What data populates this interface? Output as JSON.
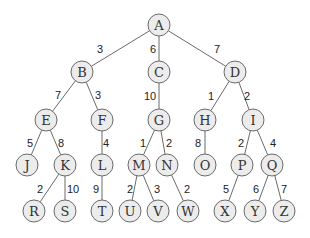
{
  "diagram": {
    "type": "weighted-tree",
    "nodes": [
      {
        "id": "A",
        "x": 159,
        "y": 25
      },
      {
        "id": "B",
        "x": 82,
        "y": 72
      },
      {
        "id": "C",
        "x": 159,
        "y": 72
      },
      {
        "id": "D",
        "x": 235,
        "y": 72
      },
      {
        "id": "E",
        "x": 46,
        "y": 120
      },
      {
        "id": "F",
        "x": 102,
        "y": 120
      },
      {
        "id": "G",
        "x": 159,
        "y": 120
      },
      {
        "id": "H",
        "x": 205,
        "y": 120
      },
      {
        "id": "I",
        "x": 253,
        "y": 120
      },
      {
        "id": "J",
        "x": 27,
        "y": 165
      },
      {
        "id": "K",
        "x": 65,
        "y": 165
      },
      {
        "id": "L",
        "x": 102,
        "y": 165
      },
      {
        "id": "M",
        "x": 139,
        "y": 165
      },
      {
        "id": "N",
        "x": 167,
        "y": 165
      },
      {
        "id": "O",
        "x": 205,
        "y": 165
      },
      {
        "id": "P",
        "x": 242,
        "y": 165
      },
      {
        "id": "Q",
        "x": 272,
        "y": 165
      },
      {
        "id": "R",
        "x": 34,
        "y": 211
      },
      {
        "id": "S",
        "x": 65,
        "y": 211
      },
      {
        "id": "T",
        "x": 102,
        "y": 211
      },
      {
        "id": "U",
        "x": 130,
        "y": 211
      },
      {
        "id": "V",
        "x": 158,
        "y": 211
      },
      {
        "id": "W",
        "x": 188,
        "y": 211
      },
      {
        "id": "X",
        "x": 225,
        "y": 211
      },
      {
        "id": "Y",
        "x": 255,
        "y": 211
      },
      {
        "id": "Z",
        "x": 284,
        "y": 211
      }
    ],
    "edges": [
      {
        "from": "A",
        "to": "B",
        "weight": "3",
        "lx": 100,
        "ly": 49
      },
      {
        "from": "A",
        "to": "C",
        "weight": "6",
        "lx": 153,
        "ly": 49
      },
      {
        "from": "A",
        "to": "D",
        "weight": "7",
        "lx": 217,
        "ly": 49
      },
      {
        "from": "B",
        "to": "E",
        "weight": "7",
        "lx": 58,
        "ly": 95
      },
      {
        "from": "B",
        "to": "F",
        "weight": "3",
        "lx": 98,
        "ly": 95
      },
      {
        "from": "C",
        "to": "G",
        "weight": "10",
        "lx": 150,
        "ly": 96
      },
      {
        "from": "D",
        "to": "H",
        "weight": "1",
        "lx": 211,
        "ly": 96
      },
      {
        "from": "D",
        "to": "I",
        "weight": "2",
        "lx": 247,
        "ly": 96
      },
      {
        "from": "E",
        "to": "J",
        "weight": "5",
        "lx": 30,
        "ly": 143
      },
      {
        "from": "E",
        "to": "K",
        "weight": "8",
        "lx": 61,
        "ly": 143
      },
      {
        "from": "F",
        "to": "L",
        "weight": "4",
        "lx": 106,
        "ly": 143
      },
      {
        "from": "G",
        "to": "M",
        "weight": "1",
        "lx": 143,
        "ly": 143
      },
      {
        "from": "G",
        "to": "N",
        "weight": "2",
        "lx": 169,
        "ly": 143
      },
      {
        "from": "H",
        "to": "O",
        "weight": "8",
        "lx": 198,
        "ly": 143
      },
      {
        "from": "I",
        "to": "P",
        "weight": "2",
        "lx": 241,
        "ly": 143
      },
      {
        "from": "I",
        "to": "Q",
        "weight": "4",
        "lx": 273,
        "ly": 143
      },
      {
        "from": "K",
        "to": "R",
        "weight": "2",
        "lx": 40,
        "ly": 189
      },
      {
        "from": "K",
        "to": "S",
        "weight": "10",
        "lx": 73,
        "ly": 189
      },
      {
        "from": "L",
        "to": "T",
        "weight": "9",
        "lx": 96,
        "ly": 189
      },
      {
        "from": "M",
        "to": "U",
        "weight": "2",
        "lx": 130,
        "ly": 189
      },
      {
        "from": "M",
        "to": "V",
        "weight": "3",
        "lx": 157,
        "ly": 189
      },
      {
        "from": "N",
        "to": "W",
        "weight": "2",
        "lx": 187,
        "ly": 189
      },
      {
        "from": "P",
        "to": "X",
        "weight": "5",
        "lx": 226,
        "ly": 189
      },
      {
        "from": "Q",
        "to": "Y",
        "weight": "6",
        "lx": 256,
        "ly": 189
      },
      {
        "from": "Q",
        "to": "Z",
        "weight": "7",
        "lx": 284,
        "ly": 189
      }
    ],
    "node_radius": 11,
    "colors": {
      "node_fill": "#ececec",
      "node_stroke": "#6a6a6a",
      "edge": "#6a6a6a",
      "text": "#333333"
    }
  }
}
